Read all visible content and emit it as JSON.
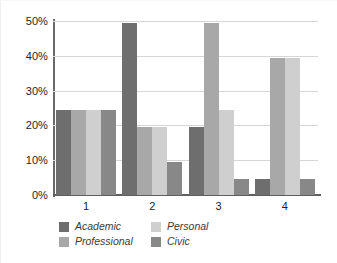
{
  "chart_data": {
    "type": "bar",
    "title": "",
    "subtitle": "",
    "xlabel": "",
    "ylabel": "",
    "categories": [
      "1",
      "2",
      "3",
      "4"
    ],
    "ylim": [
      0,
      50
    ],
    "yticks": [
      0,
      10,
      20,
      30,
      40,
      50
    ],
    "ytick_labels": [
      "0%",
      "10%",
      "20%",
      "30%",
      "40%",
      "50%"
    ],
    "grid": true,
    "legend_position": "bottom",
    "value_unit": "%",
    "series": [
      {
        "name": "Academic",
        "color": "#6e6e6e",
        "values": [
          24.5,
          49.5,
          19.5,
          4.5
        ]
      },
      {
        "name": "Professional",
        "color": "#a8a8a8",
        "values": [
          24.5,
          19.5,
          49.5,
          39.5
        ]
      },
      {
        "name": "Personal",
        "color": "#cfcfcf",
        "values": [
          24.5,
          19.5,
          24.5,
          39.5
        ]
      },
      {
        "name": "Civic",
        "color": "#888888",
        "values": [
          24.5,
          9.5,
          4.5,
          4.5
        ]
      }
    ],
    "legend_order": [
      "Academic",
      "Personal",
      "Professional",
      "Civic"
    ]
  }
}
